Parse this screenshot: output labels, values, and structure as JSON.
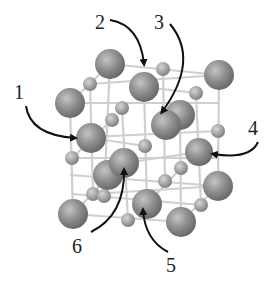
{
  "diagram": {
    "type": "crystal-lattice",
    "colors": {
      "background": "#ffffff",
      "large_sphere": "#8a8a8a",
      "small_sphere": "#a8a8a8",
      "rod": "#cfcfcf",
      "arrow": "#111111",
      "label": "#222222"
    },
    "labels": [
      {
        "id": "1",
        "text": "1",
        "x": 14,
        "y": 82
      },
      {
        "id": "2",
        "text": "2",
        "x": 95,
        "y": 12
      },
      {
        "id": "3",
        "text": "3",
        "x": 154,
        "y": 12
      },
      {
        "id": "4",
        "text": "4",
        "x": 248,
        "y": 118
      },
      {
        "id": "5",
        "text": "5",
        "x": 166,
        "y": 255
      },
      {
        "id": "6",
        "text": "6",
        "x": 72,
        "y": 236
      }
    ],
    "arrows": [
      {
        "id": "1",
        "path": "M26 106 Q30 135 75 138",
        "tip": [
          78,
          138
        ]
      },
      {
        "id": "2",
        "path": "M110 20 Q140 25 144 64",
        "tip": [
          144,
          70
        ]
      },
      {
        "id": "3",
        "path": "M170 24 Q200 60 162 112",
        "tip": [
          157,
          117
        ]
      },
      {
        "id": "4",
        "path": "M258 142 Q250 160 213 154",
        "tip": [
          209,
          153
        ]
      },
      {
        "id": "5",
        "path": "M168 252 Q145 240 143 210",
        "tip": [
          143,
          205
        ]
      },
      {
        "id": "6",
        "path": "M91 232 Q125 215 124 170",
        "tip": [
          124,
          165
        ]
      }
    ],
    "large_spheres": [
      {
        "cx": 110,
        "cy": 64,
        "r": 15
      },
      {
        "cx": 219,
        "cy": 75,
        "r": 15
      },
      {
        "cx": 70,
        "cy": 103,
        "r": 15
      },
      {
        "cx": 144,
        "cy": 87,
        "r": 15
      },
      {
        "cx": 180,
        "cy": 115,
        "r": 15
      },
      {
        "cx": 166,
        "cy": 125,
        "r": 15
      },
      {
        "cx": 91,
        "cy": 138,
        "r": 15
      },
      {
        "cx": 199,
        "cy": 152,
        "r": 14
      },
      {
        "cx": 108,
        "cy": 175,
        "r": 15
      },
      {
        "cx": 124,
        "cy": 163,
        "r": 15
      },
      {
        "cx": 218,
        "cy": 186,
        "r": 15
      },
      {
        "cx": 147,
        "cy": 204,
        "r": 15
      },
      {
        "cx": 73,
        "cy": 214,
        "r": 15
      },
      {
        "cx": 181,
        "cy": 222,
        "r": 15
      }
    ],
    "small_spheres": [
      {
        "cx": 90,
        "cy": 84,
        "r": 7
      },
      {
        "cx": 163,
        "cy": 69,
        "r": 7
      },
      {
        "cx": 122,
        "cy": 108,
        "r": 7
      },
      {
        "cx": 112,
        "cy": 120,
        "r": 7
      },
      {
        "cx": 196,
        "cy": 93,
        "r": 7
      },
      {
        "cx": 218,
        "cy": 131,
        "r": 7
      },
      {
        "cx": 72,
        "cy": 158,
        "r": 7
      },
      {
        "cx": 145,
        "cy": 146,
        "r": 7
      },
      {
        "cx": 181,
        "cy": 168,
        "r": 7
      },
      {
        "cx": 165,
        "cy": 181,
        "r": 7
      },
      {
        "cx": 93,
        "cy": 194,
        "r": 7
      },
      {
        "cx": 128,
        "cy": 220,
        "r": 7
      },
      {
        "cx": 201,
        "cy": 205,
        "r": 7
      },
      {
        "cx": 104,
        "cy": 196,
        "r": 7
      }
    ],
    "rods": [
      [
        70,
        103,
        219,
        103
      ],
      [
        90,
        84,
        219,
        75
      ],
      [
        110,
        64,
        219,
        75
      ],
      [
        70,
        138,
        218,
        131
      ],
      [
        72,
        158,
        218,
        158
      ],
      [
        70,
        175,
        218,
        186
      ],
      [
        73,
        214,
        181,
        222
      ],
      [
        73,
        194,
        201,
        205
      ],
      [
        70,
        103,
        73,
        214
      ],
      [
        90,
        84,
        93,
        194
      ],
      [
        110,
        64,
        104,
        196
      ],
      [
        122,
        108,
        128,
        220
      ],
      [
        144,
        87,
        147,
        204
      ],
      [
        163,
        69,
        165,
        181
      ],
      [
        180,
        115,
        181,
        222
      ],
      [
        196,
        93,
        201,
        205
      ],
      [
        219,
        75,
        218,
        186
      ],
      [
        70,
        103,
        110,
        64
      ],
      [
        72,
        158,
        112,
        120
      ],
      [
        73,
        214,
        110,
        175
      ],
      [
        147,
        204,
        181,
        168
      ],
      [
        181,
        222,
        218,
        186
      ],
      [
        144,
        87,
        196,
        93
      ],
      [
        91,
        138,
        145,
        146
      ],
      [
        124,
        163,
        199,
        152
      ],
      [
        93,
        194,
        218,
        186
      ]
    ]
  }
}
